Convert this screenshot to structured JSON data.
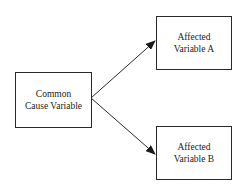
{
  "diagram": {
    "type": "causal-diagram",
    "nodes": [
      {
        "id": "cause",
        "line1": "Common",
        "line2": "Cause Variable"
      },
      {
        "id": "varA",
        "line1": "Affected",
        "line2": "Variable A"
      },
      {
        "id": "varB",
        "line1": "Affected",
        "line2": "Variable B"
      }
    ],
    "edges": [
      {
        "from": "cause",
        "to": "varA"
      },
      {
        "from": "cause",
        "to": "varB"
      }
    ],
    "colors": {
      "stroke": "#2a2a2a",
      "background": "#ffffff",
      "text": "#222222"
    }
  }
}
